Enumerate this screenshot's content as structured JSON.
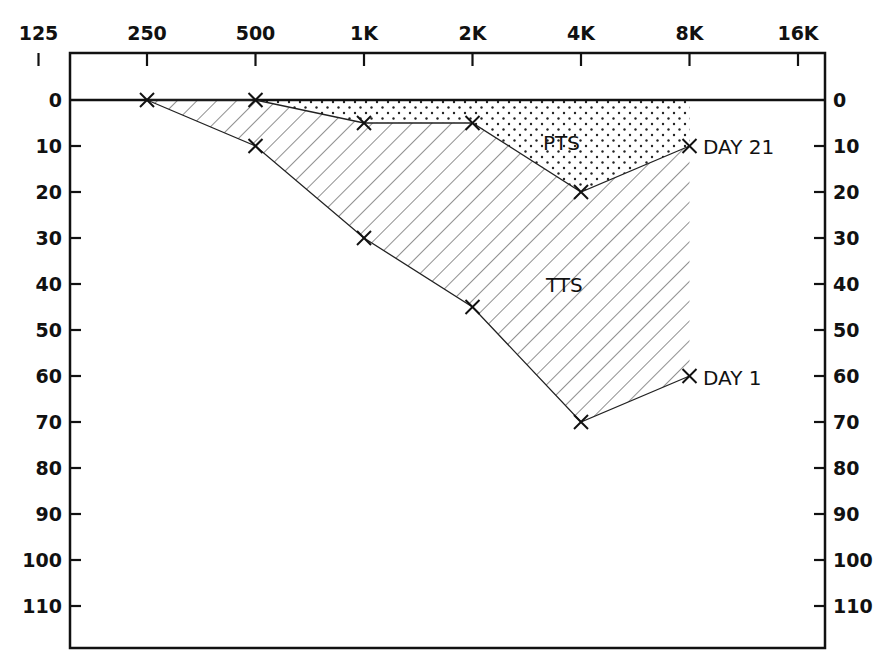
{
  "chart_data": {
    "type": "line",
    "title": "",
    "xlabel": "",
    "ylabel": "",
    "x_scale": "log2",
    "x_ticks": [
      "125",
      "250",
      "500",
      "1K",
      "2K",
      "4K",
      "8K",
      "16K"
    ],
    "x_tick_hz": [
      125,
      250,
      500,
      1000,
      2000,
      4000,
      8000,
      16000
    ],
    "y_ticks": [
      0,
      10,
      20,
      30,
      40,
      50,
      60,
      70,
      80,
      90,
      100,
      110
    ],
    "y_tick_labels": [
      "0",
      "10",
      "20",
      "30",
      "40",
      "50",
      "60",
      "70",
      "80",
      "90",
      "100",
      "110"
    ],
    "ylim": [
      0,
      115
    ],
    "y_inverted": true,
    "grid": false,
    "x": [
      250,
      500,
      1000,
      2000,
      4000,
      8000
    ],
    "series": [
      {
        "name": "DAY 1",
        "values": [
          0,
          10,
          30,
          45,
          70,
          60
        ],
        "marker": "x"
      },
      {
        "name": "DAY 21",
        "values": [
          0,
          0,
          5,
          5,
          20,
          10
        ],
        "marker": "x"
      }
    ],
    "regions": [
      {
        "name": "PTS",
        "fill": "dotted",
        "between": [
          "zero-line",
          "DAY 21"
        ]
      },
      {
        "name": "TTS",
        "fill": "hatched",
        "between": [
          "DAY 21",
          "DAY 1"
        ]
      }
    ],
    "annotations": [
      "DAY 21",
      "DAY 1",
      "PTS",
      "TTS"
    ]
  },
  "labels": {
    "pts": "PTS",
    "tts": "TTS",
    "day21": "DAY 21",
    "day1": "DAY 1"
  },
  "colors": {
    "ink": "#111111",
    "background": "#ffffff"
  }
}
